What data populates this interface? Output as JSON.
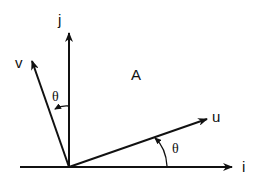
{
  "diagram": {
    "labels": {
      "j": "j",
      "i": "i",
      "v": "v",
      "u": "u",
      "region": "A",
      "theta_v": "θ",
      "theta_u": "θ"
    },
    "vectors": [
      {
        "name": "i",
        "description": "horizontal axis"
      },
      {
        "name": "j",
        "description": "vertical axis"
      },
      {
        "name": "u",
        "description": "rotated by θ from i"
      },
      {
        "name": "v",
        "description": "rotated by θ from j"
      }
    ],
    "colors": {
      "stroke": "#111111",
      "background": "#ffffff"
    }
  }
}
